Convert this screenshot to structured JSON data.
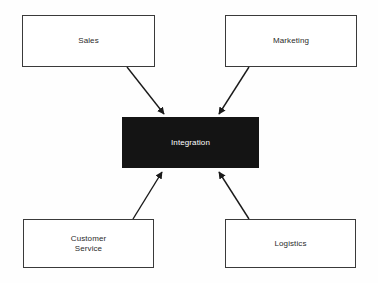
{
  "diagram": {
    "type": "hub-and-spoke",
    "background_color": "#fefefe",
    "nodes": [
      {
        "id": "sales",
        "label": "Sales",
        "style": "outline",
        "fill_color": "#ffffff",
        "border_color": "#3a3a3a",
        "text_color": "#2b2b2b"
      },
      {
        "id": "marketing",
        "label": "Marketing",
        "style": "outline",
        "fill_color": "#ffffff",
        "border_color": "#3a3a3a",
        "text_color": "#2b2b2b"
      },
      {
        "id": "integration",
        "label": "Integration",
        "style": "filled",
        "fill_color": "#141414",
        "border_color": "#141414",
        "text_color": "#ffffff"
      },
      {
        "id": "customer-service",
        "label": "Customer\nService",
        "style": "outline",
        "fill_color": "#ffffff",
        "border_color": "#3a3a3a",
        "text_color": "#2b2b2b"
      },
      {
        "id": "logistics",
        "label": "Logistics",
        "style": "outline",
        "fill_color": "#ffffff",
        "border_color": "#3a3a3a",
        "text_color": "#2b2b2b"
      }
    ],
    "edges": [
      {
        "id": "sales-to-integration",
        "from": "sales",
        "to": "integration",
        "direction": "to-center",
        "color": "#1a1a1a",
        "arrowhead": "filled-triangle"
      },
      {
        "id": "marketing-to-integration",
        "from": "marketing",
        "to": "integration",
        "direction": "to-center",
        "color": "#1a1a1a",
        "arrowhead": "filled-triangle"
      },
      {
        "id": "customer-service-to-integration",
        "from": "customer-service",
        "to": "integration",
        "direction": "to-center",
        "color": "#1a1a1a",
        "arrowhead": "filled-triangle"
      },
      {
        "id": "logistics-to-integration",
        "from": "logistics",
        "to": "integration",
        "direction": "to-center",
        "color": "#1a1a1a",
        "arrowhead": "filled-triangle"
      }
    ]
  }
}
